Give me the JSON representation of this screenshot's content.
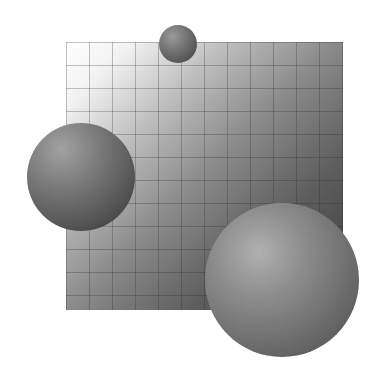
{
  "scene": {
    "description": "Abstract grayscale 3D render: a gradient grid-textured square with three shaded spheres",
    "background_color": "#ffffff",
    "square": {
      "gradient_from": "#ffffff",
      "gradient_to": "#3c3c3c",
      "grid_cell_px": 23
    },
    "spheres": [
      {
        "name": "small",
        "color": "#6f6f6f"
      },
      {
        "name": "medium",
        "color": "#7a7a7a"
      },
      {
        "name": "large",
        "color": "#8e8e8e"
      }
    ]
  }
}
